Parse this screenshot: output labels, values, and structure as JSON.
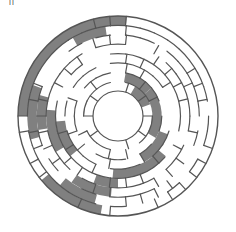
{
  "puzzle": {
    "type": "circular-maze",
    "corner_mark": "ll",
    "center": [
      118,
      116
    ],
    "outer_radius": 100,
    "inner_radius": 25,
    "rings": 8,
    "colors": {
      "background": "#ffffff",
      "wall": "#555555",
      "solution_path": "#808080"
    },
    "solution_shaded": true
  }
}
